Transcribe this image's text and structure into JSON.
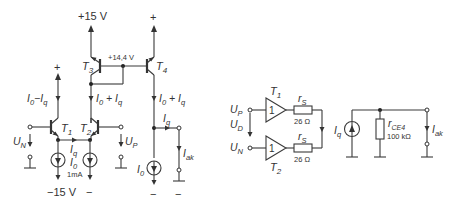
{
  "left_circuit": {
    "supply_pos": "+15 V",
    "supply_neg": "−15 V",
    "node_voltage": "+14,4 V",
    "plus": "+",
    "minus": "−",
    "transistors": {
      "t1": {
        "main": "T",
        "sub": "1"
      },
      "t2": {
        "main": "T",
        "sub": "2"
      },
      "t3": {
        "main": "T",
        "sub": "3"
      },
      "t4": {
        "main": "T",
        "sub": "4"
      }
    },
    "currents": {
      "i0_minus_iq": {
        "a": "I",
        "a_sub": "0",
        "op": "−",
        "b": "I",
        "b_sub": "q"
      },
      "i0_plus_iq": {
        "a": "I",
        "a_sub": "0",
        "op": " + ",
        "b": "I",
        "b_sub": "q"
      },
      "iq": {
        "a": "I",
        "a_sub": "q"
      },
      "i0": {
        "a": "I",
        "a_sub": "0"
      },
      "i0_value": "1mA",
      "iak": {
        "a": "I",
        "a_sub": "ak"
      }
    },
    "inputs": {
      "un": {
        "a": "U",
        "a_sub": "N"
      },
      "up": {
        "a": "U",
        "a_sub": "P"
      }
    }
  },
  "equivalent_circuit": {
    "inputs": {
      "up": {
        "a": "U",
        "a_sub": "P"
      },
      "ud": {
        "a": "U",
        "a_sub": "D"
      },
      "un": {
        "a": "U",
        "a_sub": "N"
      }
    },
    "buffers": {
      "t1": {
        "main": "T",
        "sub": "1",
        "gain": "1"
      },
      "t2": {
        "main": "T",
        "sub": "2",
        "gain": "1"
      }
    },
    "resistors": {
      "rs_top": {
        "a": "r",
        "a_sub": "S",
        "value": "26 Ω"
      },
      "rs_bottom": {
        "a": "r",
        "a_sub": "S",
        "value": "26 Ω"
      },
      "rce4": {
        "a": "r",
        "a_sub": "CE4",
        "value": "100 kΩ"
      }
    },
    "source": {
      "a": "I",
      "a_sub": "q"
    },
    "output": {
      "a": "I",
      "a_sub": "ak"
    }
  }
}
